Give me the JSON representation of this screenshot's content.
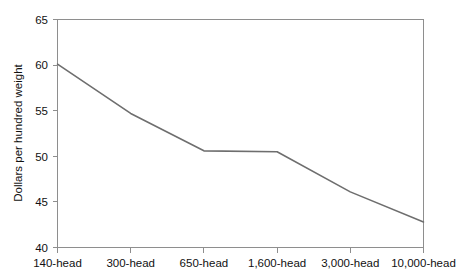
{
  "chart_data": {
    "type": "line",
    "title": "",
    "xlabel": "",
    "ylabel": "Dollars per hundred weight",
    "categories": [
      "140-head",
      "300-head",
      "650-head",
      "1,600-head",
      "3,000-head",
      "10,000-head"
    ],
    "values": [
      60.1,
      54.7,
      50.6,
      50.5,
      46.1,
      42.8
    ],
    "ylim": [
      40,
      65
    ],
    "yticks": [
      40,
      45,
      50,
      55,
      60,
      65
    ],
    "ytick_labels": [
      "40",
      "45",
      "50",
      "55",
      "60",
      "65"
    ],
    "grid": false,
    "legend": "none",
    "series": [
      {
        "name": "Cost per hundred weight",
        "color": "#6e6e6e",
        "values": [
          60.1,
          54.7,
          50.6,
          50.5,
          46.1,
          42.8
        ]
      }
    ]
  },
  "axes": {
    "y_label": "Dollars per hundred weight",
    "y_tick_0": "40",
    "y_tick_1": "45",
    "y_tick_2": "50",
    "y_tick_3": "55",
    "y_tick_4": "60",
    "y_tick_5": "65",
    "x_tick_0": "140-head",
    "x_tick_1": "300-head",
    "x_tick_2": "650-head",
    "x_tick_3": "1,600-head",
    "x_tick_4": "3,000-head",
    "x_tick_5": "10,000-head"
  },
  "colors": {
    "line": "#6e6e6e",
    "frame": "#8e8e8e",
    "text": "#111111",
    "background": "#ffffff"
  }
}
